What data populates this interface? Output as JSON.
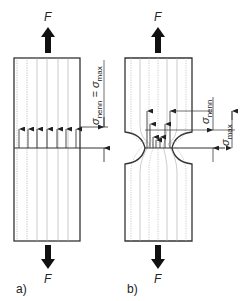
{
  "figure": {
    "panels": [
      {
        "id": "a",
        "label": "a)",
        "force_top": "F",
        "force_bottom": "F",
        "stress_label": {
          "sym1": "σ",
          "sub1": "nenn",
          "eq": " = ",
          "sym2": "σ",
          "sub2": "max"
        },
        "description": "Unnotched bar under tension: uniform stress distribution"
      },
      {
        "id": "b",
        "label": "b)",
        "force_top": "F",
        "force_bottom": "F",
        "stress_nominal": {
          "sym": "σ",
          "sub": "nenn"
        },
        "stress_max": {
          "sym": "σ",
          "sub": "max"
        },
        "description": "Notched bar under tension: stress concentration at notch root"
      }
    ]
  }
}
